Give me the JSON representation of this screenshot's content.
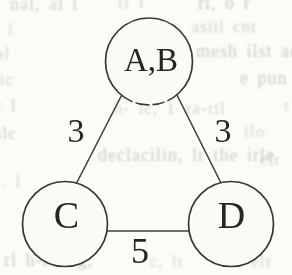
{
  "figure": {
    "kind": "weighted-graph-scan",
    "nodes": [
      {
        "id": "AB",
        "label": "A,B"
      },
      {
        "id": "C",
        "label": "C"
      },
      {
        "id": "D",
        "label": "D"
      }
    ],
    "edges": [
      {
        "from": "AB",
        "to": "C",
        "weight": "3"
      },
      {
        "from": "AB",
        "to": "D",
        "weight": "3"
      },
      {
        "from": "C",
        "to": "D",
        "weight": "5"
      }
    ],
    "ink_color": "#26251f",
    "paper_color": "#fbfaf6"
  },
  "bleed_text": {
    "fragments": [
      {
        "text": "nal, al t",
        "x": 10,
        "y": -6,
        "size": 18,
        "opacity": 0.5
      },
      {
        "text": "tl f",
        "x": 118,
        "y": -8,
        "size": 18,
        "opacity": 0.45
      },
      {
        "text": "ri, o r",
        "x": 198,
        "y": -7,
        "size": 18,
        "opacity": 0.6
      },
      {
        "text": "l",
        "x": 8,
        "y": 20,
        "size": 17,
        "opacity": 0.4
      },
      {
        "text": "r, asiil cnt",
        "x": 172,
        "y": 17,
        "size": 17,
        "opacity": 0.5
      },
      {
        "text": "al",
        "x": -4,
        "y": 44,
        "size": 17,
        "opacity": 0.45
      },
      {
        "text": "mesh ilst ac",
        "x": 196,
        "y": 41,
        "size": 18,
        "opacity": 0.55
      },
      {
        "text": "tic",
        "x": -6,
        "y": 70,
        "size": 17,
        "opacity": 0.45
      },
      {
        "text": "e pun",
        "x": 240,
        "y": 68,
        "size": 18,
        "opacity": 0.55
      },
      {
        "text": "r l",
        "x": -4,
        "y": 96,
        "size": 17,
        "opacity": 0.5
      },
      {
        "text": "h- lc, 1 za-ril",
        "x": 114,
        "y": 99,
        "size": 17,
        "opacity": 0.45
      },
      {
        "text": "t",
        "x": 284,
        "y": 96,
        "size": 17,
        "opacity": 0.4
      },
      {
        "text": "slc",
        "x": -5,
        "y": 124,
        "size": 17,
        "opacity": 0.55
      },
      {
        "text": "ilo",
        "x": 244,
        "y": 122,
        "size": 17,
        "opacity": 0.4
      },
      {
        "text": "declacilin, lr the irle",
        "x": 98,
        "y": 145,
        "size": 18,
        "opacity": 0.55
      },
      {
        "text": "elr",
        "x": 260,
        "y": 150,
        "size": 17,
        "opacity": 0.45
      },
      {
        "text": "t. l",
        "x": -4,
        "y": 172,
        "size": 17,
        "opacity": 0.45
      },
      {
        "text": "rl h-lc. lg,",
        "x": 4,
        "y": 250,
        "size": 18,
        "opacity": 0.55
      },
      {
        "text": "c, lt",
        "x": 150,
        "y": 252,
        "size": 17,
        "opacity": 0.4
      },
      {
        "text": "l, elr",
        "x": 232,
        "y": 252,
        "size": 17,
        "opacity": 0.45
      }
    ]
  }
}
